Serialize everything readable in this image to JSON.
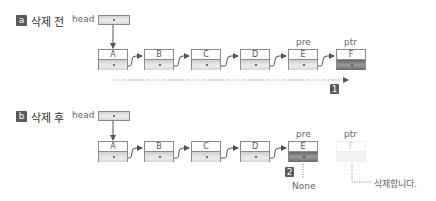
{
  "panel_a": {
    "badge": "a",
    "title": "삭제 전",
    "head_label": "head",
    "nodes": [
      "A",
      "B",
      "C",
      "D",
      "E",
      "F"
    ],
    "pre_label": "pre",
    "ptr_label": "ptr",
    "step_badge": "1"
  },
  "panel_b": {
    "badge": "b",
    "title": "삭제 후",
    "head_label": "head",
    "nodes": [
      "A",
      "B",
      "C",
      "D",
      "E",
      "F"
    ],
    "pre_label": "pre",
    "ptr_label": "ptr",
    "step_badge": "2",
    "none_label": "None",
    "delete_label": "삭제합니다."
  },
  "colors": {
    "badge": "#5a5a5a",
    "border": "#8a8a8a",
    "dark_cell": "#6a6a6a"
  }
}
